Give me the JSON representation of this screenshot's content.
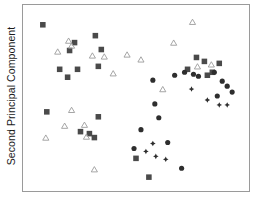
{
  "chart_data": {
    "type": "scatter",
    "title": "",
    "xlabel": "",
    "ylabel": "Second Principal Component",
    "xlim": [
      0,
      228
    ],
    "ylim": [
      0,
      188
    ],
    "grid": false,
    "legend": "none",
    "axis_ticks": {
      "x": [],
      "y": []
    },
    "colors": {
      "square": "#4a4a4a",
      "circle": "#2e2e2e",
      "diamond": "#2e2e2e",
      "triangle_stroke": "#9b9b9b",
      "frame": "#9a9a9a",
      "background": "#ffffff",
      "text": "#1a1a1a"
    },
    "marker_sizes": {
      "square": 5.6,
      "circle": 5.2,
      "diamond": 5.6,
      "triangle": 6.2
    },
    "series": [
      {
        "name": "square",
        "marker": "square",
        "filled": true,
        "color": "#4a4a4a",
        "points": [
          [
            20,
            20
          ],
          [
            73,
            31
          ],
          [
            47,
            46
          ],
          [
            52,
            38
          ],
          [
            37,
            65
          ],
          [
            55,
            65
          ],
          [
            76,
            62
          ],
          [
            45,
            73
          ],
          [
            79,
            45
          ],
          [
            24,
            108
          ],
          [
            76,
            113
          ],
          [
            58,
            128
          ],
          [
            67,
            130
          ],
          [
            72,
            134
          ],
          [
            114,
            155
          ],
          [
            127,
            174
          ],
          [
            166,
            65
          ],
          [
            175,
            53
          ],
          [
            183,
            57
          ],
          [
            186,
            71
          ],
          [
            191,
            68
          ],
          [
            198,
            59
          ]
        ]
      },
      {
        "name": "circle",
        "marker": "circle",
        "filled": true,
        "color": "#2e2e2e",
        "points": [
          [
            131,
            76
          ],
          [
            153,
            71
          ],
          [
            163,
            68
          ],
          [
            172,
            70
          ],
          [
            177,
            72
          ],
          [
            193,
            68
          ],
          [
            201,
            77
          ],
          [
            133,
            100
          ],
          [
            137,
            114
          ],
          [
            206,
            82
          ],
          [
            211,
            88
          ],
          [
            196,
            92
          ],
          [
            119,
            126
          ],
          [
            112,
            145
          ],
          [
            146,
            139
          ],
          [
            160,
            165
          ]
        ]
      },
      {
        "name": "diamond",
        "marker": "diamond",
        "filled": true,
        "color": "#2e2e2e",
        "points": [
          [
            170,
            85
          ],
          [
            186,
            96
          ],
          [
            198,
            101
          ],
          [
            206,
            101
          ],
          [
            124,
            148
          ],
          [
            131,
            140
          ],
          [
            134,
            153
          ],
          [
            144,
            156
          ]
        ]
      },
      {
        "name": "triangle",
        "marker": "triangle",
        "filled": false,
        "color": "#9b9b9b",
        "points": [
          [
            46,
            36
          ],
          [
            49,
            41
          ],
          [
            35,
            47
          ],
          [
            70,
            51
          ],
          [
            82,
            52
          ],
          [
            105,
            50
          ],
          [
            119,
            55
          ],
          [
            91,
            69
          ],
          [
            171,
            17
          ],
          [
            152,
            38
          ],
          [
            176,
            62
          ],
          [
            190,
            60
          ],
          [
            141,
            85
          ],
          [
            49,
            106
          ],
          [
            42,
            122
          ],
          [
            62,
            121
          ],
          [
            64,
            133
          ],
          [
            23,
            134
          ],
          [
            72,
            166
          ]
        ]
      }
    ]
  },
  "axes": {
    "y_title": "Second Principal Component",
    "x_title": ""
  }
}
